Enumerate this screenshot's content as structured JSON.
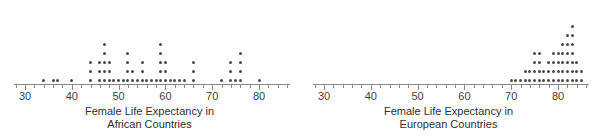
{
  "figure": {
    "width": 598,
    "height": 136,
    "background": "#ffffff",
    "dot_color": "#4a4a4a",
    "axis_color": "#8a8a8a",
    "text_color": "#3a3a3a"
  },
  "panels": [
    {
      "id": "african",
      "axis_title_line1": "Female Life Expectancy in",
      "axis_title_line2": "African Countries",
      "tick_labels": [
        "30",
        "40",
        "50",
        "60",
        "70",
        "80"
      ],
      "tick_values": [
        30,
        40,
        50,
        60,
        70,
        80
      ]
    },
    {
      "id": "european",
      "axis_title_line1": "Female Life Expectancy in",
      "axis_title_line2": "European Countries",
      "tick_labels": [
        "30",
        "40",
        "50",
        "60",
        "70",
        "80"
      ],
      "tick_values": [
        30,
        40,
        50,
        60,
        70,
        80
      ]
    }
  ],
  "chart_data": [
    {
      "type": "scatter",
      "plot_kind": "dotplot",
      "title": "Female Life Expectancy in African Countries",
      "xlabel": "Female Life Expectancy in African Countries",
      "ylabel": "",
      "xlim": [
        28,
        87
      ],
      "ylim": [
        0,
        7
      ],
      "grid": false,
      "legend": null,
      "x_major_ticks": [
        30,
        40,
        50,
        60,
        70,
        80
      ],
      "x_minor_tick_step": 2,
      "stacks": [
        {
          "x": 34,
          "count": 1
        },
        {
          "x": 36,
          "count": 1
        },
        {
          "x": 37,
          "count": 1
        },
        {
          "x": 40,
          "count": 1
        },
        {
          "x": 44,
          "count": 3
        },
        {
          "x": 46,
          "count": 3
        },
        {
          "x": 47,
          "count": 5
        },
        {
          "x": 48,
          "count": 3
        },
        {
          "x": 49,
          "count": 1
        },
        {
          "x": 50,
          "count": 1
        },
        {
          "x": 51,
          "count": 1
        },
        {
          "x": 52,
          "count": 4
        },
        {
          "x": 53,
          "count": 2
        },
        {
          "x": 54,
          "count": 1
        },
        {
          "x": 55,
          "count": 3
        },
        {
          "x": 56,
          "count": 1
        },
        {
          "x": 57,
          "count": 1
        },
        {
          "x": 58,
          "count": 1
        },
        {
          "x": 59,
          "count": 5
        },
        {
          "x": 60,
          "count": 3
        },
        {
          "x": 61,
          "count": 1
        },
        {
          "x": 62,
          "count": 1
        },
        {
          "x": 63,
          "count": 1
        },
        {
          "x": 64,
          "count": 1
        },
        {
          "x": 66,
          "count": 3
        },
        {
          "x": 72,
          "count": 1
        },
        {
          "x": 74,
          "count": 3
        },
        {
          "x": 75,
          "count": 1
        },
        {
          "x": 76,
          "count": 4
        },
        {
          "x": 80,
          "count": 1
        }
      ]
    },
    {
      "type": "scatter",
      "plot_kind": "dotplot",
      "title": "Female Life Expectancy in European Countries",
      "xlabel": "Female Life Expectancy in European Countries",
      "ylabel": "",
      "xlim": [
        28,
        87
      ],
      "ylim": [
        0,
        8
      ],
      "grid": false,
      "legend": null,
      "x_major_ticks": [
        30,
        40,
        50,
        60,
        70,
        80
      ],
      "x_minor_tick_step": 2,
      "stacks": [
        {
          "x": 70,
          "count": 1
        },
        {
          "x": 71,
          "count": 1
        },
        {
          "x": 72,
          "count": 1
        },
        {
          "x": 73,
          "count": 2
        },
        {
          "x": 74,
          "count": 2
        },
        {
          "x": 75,
          "count": 4
        },
        {
          "x": 76,
          "count": 4
        },
        {
          "x": 77,
          "count": 2
        },
        {
          "x": 78,
          "count": 3
        },
        {
          "x": 79,
          "count": 4
        },
        {
          "x": 80,
          "count": 4
        },
        {
          "x": 81,
          "count": 5
        },
        {
          "x": 82,
          "count": 6
        },
        {
          "x": 83,
          "count": 7
        },
        {
          "x": 84,
          "count": 3
        },
        {
          "x": 85,
          "count": 2
        }
      ]
    }
  ]
}
